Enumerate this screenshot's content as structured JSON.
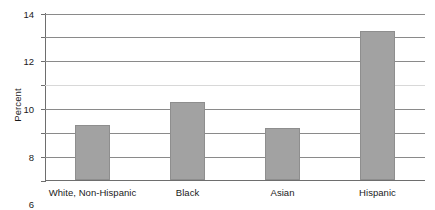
{
  "chart_data": {
    "type": "bar",
    "title": "",
    "subtitle": "",
    "xlabel": "",
    "ylabel": "Percent",
    "categories": [
      "White, Non-Hispanic",
      "Black",
      "Asian",
      "Hispanic"
    ],
    "values": [
      4.6,
      6.5,
      4.4,
      12.5
    ],
    "ylim": [
      0,
      14
    ],
    "ytick_step": 2,
    "yticks": [
      "0",
      "2",
      "4",
      "6",
      "8",
      "10",
      "12",
      "14"
    ],
    "grid": "horizontal",
    "legend": "none",
    "series": [
      {
        "name": "Percent",
        "values": [
          4.6,
          6.5,
          4.4,
          12.5
        ]
      }
    ],
    "colors": {
      "bar_fill": "#a2a2a2",
      "bar_border": "#8e8e8e",
      "gridline": "#8a8a8a",
      "axis": "#6e6e6e",
      "text": "#1a1a1a",
      "background": "#ffffff"
    }
  }
}
